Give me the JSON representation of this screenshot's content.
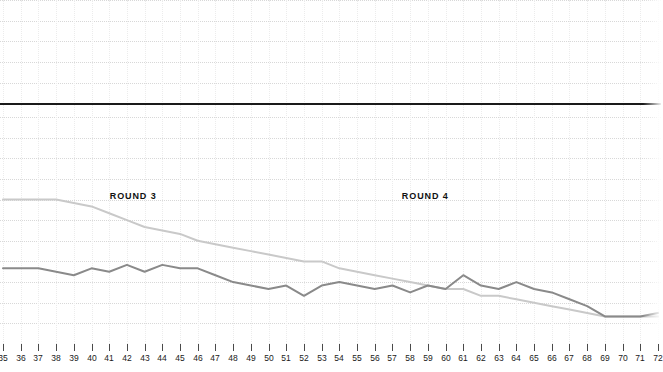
{
  "chart_data": {
    "type": "line",
    "title": "",
    "subtitle": "",
    "xlabel": "",
    "ylabel": "",
    "grid": true,
    "legend_position": "inline-annotations",
    "xlim": [
      35,
      72
    ],
    "ylim": [
      0,
      100
    ],
    "x": [
      35,
      36,
      37,
      38,
      39,
      40,
      41,
      42,
      43,
      44,
      45,
      46,
      47,
      48,
      49,
      50,
      51,
      52,
      53,
      54,
      55,
      56,
      57,
      58,
      59,
      60,
      61,
      62,
      63,
      64,
      65,
      66,
      67,
      68,
      69,
      70,
      71,
      72
    ],
    "tick_labels": [
      "35",
      "36",
      "37",
      "38",
      "39",
      "40",
      "41",
      "42",
      "43",
      "44",
      "45",
      "46",
      "47",
      "48",
      "49",
      "50",
      "51",
      "52",
      "53",
      "54",
      "55",
      "56",
      "57",
      "58",
      "59",
      "60",
      "61",
      "62",
      "63",
      "64",
      "65",
      "66",
      "67",
      "68",
      "69",
      "70",
      "71",
      "72"
    ],
    "annotations": [
      {
        "text": "ROUND 3",
        "x": 42.5
      },
      {
        "text": "ROUND 4",
        "x": 59.0
      }
    ],
    "reference_line": {
      "value": 70,
      "color": "#1a1a1a",
      "width": 2
    },
    "series": [
      {
        "name": "light-line",
        "color": "#c9c9c9",
        "width": 2,
        "values": [
          42,
          42,
          42,
          42,
          41,
          40,
          38,
          36,
          34,
          33,
          32,
          30,
          29,
          28,
          27,
          26,
          25,
          24,
          24,
          22,
          21,
          20,
          19,
          18,
          17,
          16,
          16,
          14,
          14,
          13,
          12,
          11,
          10,
          9,
          8,
          8,
          8,
          8
        ]
      },
      {
        "name": "dark-line",
        "color": "#8a8a8a",
        "width": 2,
        "values": [
          22,
          22,
          22,
          21,
          20,
          22,
          21,
          23,
          21,
          23,
          22,
          22,
          20,
          18,
          17,
          16,
          17,
          14,
          17,
          18,
          17,
          16,
          17,
          15,
          17,
          16,
          20,
          17,
          16,
          18,
          16,
          15,
          13,
          11,
          8,
          8,
          8,
          9
        ]
      }
    ],
    "y_gridlines": [
      6,
      12,
      18,
      24,
      30,
      36,
      42,
      48,
      54,
      60,
      66,
      70,
      76,
      82,
      88,
      94,
      100
    ]
  }
}
